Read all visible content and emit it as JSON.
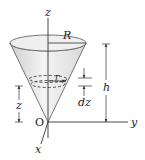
{
  "diagram": {
    "labels": {
      "z_axis": "z",
      "y_axis": "y",
      "x_axis": "x",
      "origin": "O",
      "top_radius": "R",
      "slice_radius": "r",
      "height": "h",
      "slice_height": "z",
      "slice_thickness": "dz"
    },
    "colors": {
      "cone_fill": "#e6e6e6",
      "cone_top": "#f2f2f2",
      "line": "#333333",
      "background": "#ffffff"
    }
  }
}
